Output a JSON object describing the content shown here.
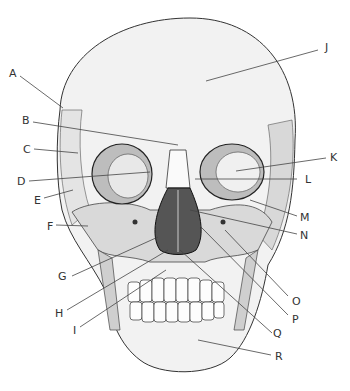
{
  "diagram": {
    "labels": [
      {
        "id": "A",
        "text": "A",
        "x": 9,
        "y": 68,
        "lx1": 20,
        "ly1": 76,
        "lx2": 63,
        "ly2": 108
      },
      {
        "id": "B",
        "text": "B",
        "x": 22,
        "y": 115,
        "lx1": 33,
        "ly1": 122,
        "lx2": 178,
        "ly2": 145
      },
      {
        "id": "C",
        "text": "C",
        "x": 23,
        "y": 144,
        "lx1": 34,
        "ly1": 149,
        "lx2": 78,
        "ly2": 153
      },
      {
        "id": "D",
        "text": "D",
        "x": 17,
        "y": 176,
        "lx1": 29,
        "ly1": 181,
        "lx2": 150,
        "ly2": 172
      },
      {
        "id": "E",
        "text": "E",
        "x": 34,
        "y": 195,
        "lx1": 44,
        "ly1": 198,
        "lx2": 73,
        "ly2": 190
      },
      {
        "id": "F",
        "text": "F",
        "x": 47,
        "y": 221,
        "lx1": 56,
        "ly1": 225,
        "lx2": 88,
        "ly2": 226
      },
      {
        "id": "G",
        "text": "G",
        "x": 58,
        "y": 271,
        "lx1": 72,
        "ly1": 276,
        "lx2": 158,
        "ly2": 237
      },
      {
        "id": "H",
        "text": "H",
        "x": 55,
        "y": 308,
        "lx1": 67,
        "ly1": 310,
        "lx2": 168,
        "ly2": 250
      },
      {
        "id": "I",
        "text": "I",
        "x": 73,
        "y": 325,
        "lx1": 80,
        "ly1": 327,
        "lx2": 166,
        "ly2": 270
      },
      {
        "id": "J",
        "text": "J",
        "x": 325,
        "y": 42,
        "lx1": 318,
        "ly1": 50,
        "lx2": 206,
        "ly2": 81
      },
      {
        "id": "K",
        "text": "K",
        "x": 330,
        "y": 152,
        "lx1": 326,
        "ly1": 158,
        "lx2": 236,
        "ly2": 171
      },
      {
        "id": "L",
        "text": "L",
        "x": 305,
        "y": 174,
        "lx1": 297,
        "ly1": 179,
        "lx2": 195,
        "ly2": 179
      },
      {
        "id": "M",
        "text": "M",
        "x": 300,
        "y": 212,
        "lx1": 297,
        "ly1": 216,
        "lx2": 250,
        "ly2": 200
      },
      {
        "id": "N",
        "text": "N",
        "x": 300,
        "y": 230,
        "lx1": 297,
        "ly1": 234,
        "lx2": 190,
        "ly2": 210
      },
      {
        "id": "O",
        "text": "O",
        "x": 292,
        "y": 296,
        "lx1": 288,
        "ly1": 296,
        "lx2": 225,
        "ly2": 230
      },
      {
        "id": "P",
        "text": "P",
        "x": 292,
        "y": 314,
        "lx1": 288,
        "ly1": 315,
        "lx2": 200,
        "ly2": 226
      },
      {
        "id": "Q",
        "text": "Q",
        "x": 273,
        "y": 328,
        "lx1": 272,
        "ly1": 333,
        "lx2": 180,
        "ly2": 250
      },
      {
        "id": "R",
        "text": "R",
        "x": 275,
        "y": 351,
        "lx1": 271,
        "ly1": 355,
        "lx2": 198,
        "ly2": 340
      }
    ]
  }
}
